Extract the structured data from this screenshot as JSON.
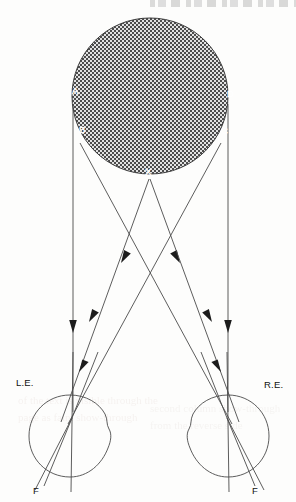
{
  "figure": {
    "type": "optics-ray-diagram",
    "background_color": "#fdfdfc",
    "line_color": "#4b4b4b",
    "arrow_color": "#1c1c1c"
  },
  "object": {
    "name": "hatched-disc",
    "shape": "circle",
    "center_x": 150,
    "center_y": 96,
    "radius": 78,
    "fill_pattern": "crosshatch",
    "pattern_colors": [
      "#4a4a4a",
      "#dcdcdc"
    ]
  },
  "object_labels": [
    {
      "text": "A",
      "x": 72,
      "y": 94,
      "style": "white"
    },
    {
      "text": "B",
      "x": 79,
      "y": 133,
      "style": "white"
    },
    {
      "text": "C",
      "x": 221,
      "y": 134,
      "style": "white"
    },
    {
      "text": "D",
      "x": 227,
      "y": 97,
      "style": "white"
    },
    {
      "text": "X",
      "x": 145,
      "y": 175,
      "style": "white"
    }
  ],
  "eyes": [
    {
      "name": "left-eye",
      "label": "L.E.",
      "label_x": 16,
      "label_y": 386,
      "center_x": 70,
      "center_y": 436,
      "radius": 41,
      "nodal_x": 72,
      "nodal_y": 418,
      "fovea_label": "F",
      "fovea_label_x": 33,
      "fovea_label_y": 494
    },
    {
      "name": "right-eye",
      "label": "R.E.",
      "label_x": 264,
      "label_y": 388,
      "center_x": 228,
      "center_y": 436,
      "radius": 41,
      "nodal_x": 227,
      "nodal_y": 418,
      "fovea_label": "F",
      "fovea_label_x": 252,
      "fovea_label_y": 494
    }
  ],
  "rays": [
    {
      "name": "ray-A-to-left-eye",
      "from": "A",
      "to": "L.E.",
      "x1": 73,
      "y1": 104,
      "x2": 73,
      "y2": 410,
      "arrow_at_y": 326
    },
    {
      "name": "ray-D-to-right-eye",
      "from": "D",
      "to": "R.E.",
      "x1": 228,
      "y1": 104,
      "x2": 228,
      "y2": 410,
      "arrow_at_y": 326
    },
    {
      "name": "ray-B-to-right-eye",
      "from": "B",
      "to": "R.E.",
      "x1": 80,
      "y1": 143,
      "x2": 227,
      "y2": 418,
      "arrow_at_y": 250
    },
    {
      "name": "ray-C-to-left-eye",
      "from": "C",
      "to": "L.E.",
      "x1": 221,
      "y1": 143,
      "x2": 72,
      "y2": 418,
      "arrow_at_y": 250
    },
    {
      "name": "ray-X-to-left-eye",
      "from": "X",
      "to": "L.E.",
      "x1": 149,
      "y1": 180,
      "x2": 60,
      "y2": 420,
      "arrow_at_y": 322
    },
    {
      "name": "ray-X-to-right-eye",
      "from": "X",
      "to": "R.E.",
      "x1": 150,
      "y1": 180,
      "x2": 240,
      "y2": 420,
      "arrow_at_y": 322
    }
  ],
  "retinal_rays": {
    "description": "continuation of rays inside each eye from nodal point to retina",
    "left_eye_targets": [
      {
        "name": "retina-point-far",
        "x": 36,
        "y": 481
      },
      {
        "name": "retina-point-near",
        "x": 46,
        "y": 478
      },
      {
        "name": "retina-fovea",
        "x": 70,
        "y": 477
      }
    ],
    "right_eye_targets": [
      {
        "name": "retina-point-far",
        "x": 262,
        "y": 481
      },
      {
        "name": "retina-point-near",
        "x": 252,
        "y": 478
      },
      {
        "name": "retina-fovea",
        "x": 228,
        "y": 477
      }
    ]
  },
  "ghost_text": {
    "left": "of the text is visible through the page as faint show-through",
    "right": "second column show-through from the reverse side"
  }
}
